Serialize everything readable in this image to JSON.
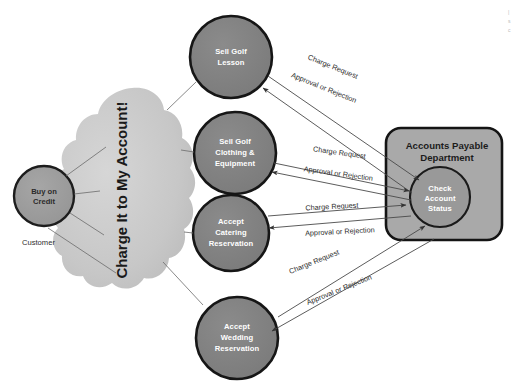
{
  "diagram": {
    "colors": {
      "node_fill": "#808080",
      "node_stroke": "#1a1a1a",
      "cloud_fill": "#c9c9c9",
      "box_fill": "#a8a8a8",
      "box_stroke": "#1a1a1a",
      "actor_fill": "#9d9d9d",
      "line": "#4a4a4a",
      "label_text": "#2e2e2e",
      "node_text": "#ffffff",
      "background": "#ffffff"
    },
    "cloud": {
      "label": "Charge It to My Account!"
    },
    "actor": {
      "node_label_line1": "Buy on",
      "node_label_line2": "Credit",
      "role_label": "Customer"
    },
    "use_cases": [
      {
        "id": "sell-golf-lesson",
        "lines": [
          "Sell Golf",
          "Lesson"
        ]
      },
      {
        "id": "sell-golf-clothing",
        "lines": [
          "Sell Golf",
          "Clothing &",
          "Equipment"
        ]
      },
      {
        "id": "accept-catering-reservation",
        "lines": [
          "Accept",
          "Catering",
          "Reservation"
        ]
      },
      {
        "id": "accept-wedding-reservation",
        "lines": [
          "Accept",
          "Wedding",
          "Reservation"
        ]
      }
    ],
    "system_box": {
      "title_line1": "Accounts Payable",
      "title_line2": "Department",
      "inner_node": {
        "lines": [
          "Check",
          "Account",
          "Status"
        ]
      }
    },
    "flows": [
      {
        "id": "flow-1-request",
        "label": "Charge Request"
      },
      {
        "id": "flow-1-response",
        "label": "Approval or Rejection"
      },
      {
        "id": "flow-2-request",
        "label": "Charge Request"
      },
      {
        "id": "flow-2-response",
        "label": "Approval or Rejection"
      },
      {
        "id": "flow-3-request",
        "label": "Charge Request"
      },
      {
        "id": "flow-3-response",
        "label": "Approval or Rejection"
      },
      {
        "id": "flow-4-request",
        "label": "Charge Request"
      },
      {
        "id": "flow-4-response",
        "label": "Approval or Rejection"
      }
    ],
    "corner_note": {
      "line1": "|",
      "line2": "s",
      "line3": "c"
    }
  }
}
